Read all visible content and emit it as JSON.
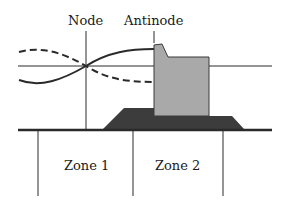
{
  "labels": {
    "node": "Node",
    "antinode": "Antinode",
    "zone1": "Zone 1",
    "zone2": "Zone 2"
  },
  "colors": {
    "line": "#2a2a2a",
    "building": "#a9a9a9",
    "foundation": "#3c3c3c",
    "background": "#ffffff"
  }
}
